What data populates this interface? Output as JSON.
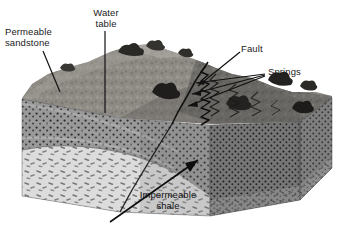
{
  "figure": {
    "type": "geologic-block-diagram",
    "background_color": "#ffffff"
  },
  "labels": {
    "permeable_sandstone": "Permeable\nsandstone",
    "water_table": "Water\ntable",
    "fault": "Fault",
    "springs": "Springs",
    "impermeable_shale": "Impermeable\nshale"
  },
  "label_colors": {
    "text_dark": "#1c1c1c",
    "leader_line": "#111111"
  },
  "units": [
    {
      "name": "permeable sandstone",
      "pattern": "stipple-dots",
      "fill": "#8c8c8c",
      "label_key": "permeable_sandstone"
    },
    {
      "name": "impermeable shale",
      "pattern": "dash-hatch",
      "fill": "#d8d8d8",
      "label_key": "impermeable_shale"
    },
    {
      "name": "faulted block sandstone",
      "pattern": "stipple-dots-dark",
      "fill": "#7d7d7d",
      "label_key": "fault"
    }
  ],
  "features": [
    {
      "name": "water table",
      "style": "leader-line",
      "label_key": "water_table"
    },
    {
      "name": "fault plane",
      "style": "diagonal-break",
      "label_key": "fault"
    },
    {
      "name": "springs",
      "style": "arrow-leaders",
      "count": 3,
      "label_key": "springs"
    },
    {
      "name": "ground surface",
      "style": "rough-terrain-with-shrubs"
    }
  ]
}
